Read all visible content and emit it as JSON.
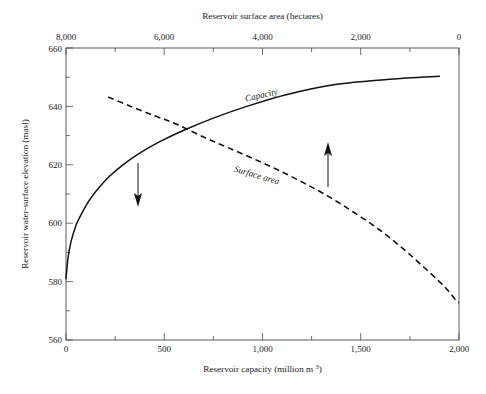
{
  "figure": {
    "background_color": "#ffffff",
    "line_color": "#111111",
    "frame_color": "#4a4a4a"
  },
  "chart_data": {
    "type": "line",
    "title": "",
    "xlabel": "Reservoir capacity (million m³)",
    "ylabel": "Reservoir water-surface elevation (masl)",
    "top_axis_label": "Reservoir surface area (hectares)",
    "xlim": [
      0,
      2000
    ],
    "ylim": [
      560,
      660
    ],
    "top_xlim": [
      8000,
      0
    ],
    "grid": false,
    "legend_position": "inline-curve-labels",
    "axes": {
      "bottom": {
        "label": "Reservoir capacity (million m³)",
        "ticks": [
          0,
          500,
          1000,
          1500,
          2000
        ],
        "tick_labels": [
          "0",
          "500",
          "1,000",
          "1,500",
          "2,000"
        ],
        "minor_tick_interval": 250
      },
      "left": {
        "label": "Reservoir water-surface elevation (masl)",
        "ticks": [
          560,
          580,
          600,
          620,
          640,
          660
        ],
        "tick_labels": [
          "560",
          "580",
          "600",
          "620",
          "640",
          "660"
        ],
        "minor_tick_interval": 10
      },
      "top": {
        "label": "Reservoir surface area (hectares)",
        "ticks": [
          8000,
          6000,
          4000,
          2000,
          0
        ],
        "tick_labels": [
          "8,000",
          "6,000",
          "4,000",
          "2,000",
          "0"
        ],
        "minor_tick_interval": 1000,
        "direction": "reversed"
      }
    },
    "series": [
      {
        "name": "Capacity",
        "style": "solid",
        "label": "Capacity",
        "x_axis": "bottom",
        "points": [
          [
            0,
            581.0
          ],
          [
            4,
            584.0
          ],
          [
            10,
            588.0
          ],
          [
            20,
            592.0
          ],
          [
            35,
            596.0
          ],
          [
            55,
            600.0
          ],
          [
            85,
            604.0
          ],
          [
            120,
            608.0
          ],
          [
            165,
            612.0
          ],
          [
            220,
            616.0
          ],
          [
            290,
            620.0
          ],
          [
            375,
            624.0
          ],
          [
            480,
            628.0
          ],
          [
            605,
            632.0
          ],
          [
            750,
            636.0
          ],
          [
            920,
            640.0
          ],
          [
            1120,
            644.0
          ],
          [
            1370,
            647.5
          ],
          [
            1650,
            649.3
          ],
          [
            1900,
            650.3
          ]
        ]
      },
      {
        "name": "Surface area",
        "style": "dashed",
        "label": "Surface area",
        "x_axis": "bottom",
        "points": [
          [
            215,
            643.2
          ],
          [
            330,
            640.0
          ],
          [
            450,
            636.8
          ],
          [
            560,
            634.0
          ],
          [
            700,
            629.5
          ],
          [
            820,
            626.0
          ],
          [
            950,
            622.2
          ],
          [
            1080,
            618.2
          ],
          [
            1210,
            613.8
          ],
          [
            1340,
            609.0
          ],
          [
            1470,
            603.5
          ],
          [
            1600,
            597.5
          ],
          [
            1720,
            591.0
          ],
          [
            1820,
            585.0
          ],
          [
            1900,
            580.0
          ],
          [
            1950,
            576.5
          ],
          [
            1985,
            573.5
          ],
          [
            2000,
            572.8
          ]
        ]
      }
    ],
    "annotations": [
      {
        "name": "capacity-down-arrow",
        "direction": "down",
        "x": 370,
        "y_from": 620.5,
        "y_to": 607.5,
        "meaning": "Capacity curve reads against the bottom axis"
      },
      {
        "name": "surface-area-up-arrow",
        "direction": "up",
        "x": 1335,
        "y_from": 609.5,
        "y_to": 625.5,
        "meaning": "Surface area curve reads against the top axis"
      }
    ]
  }
}
